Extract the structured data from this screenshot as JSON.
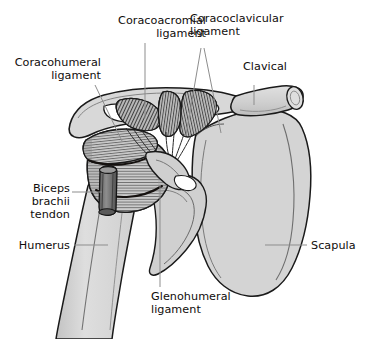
{
  "figure": {
    "background_color": "#ffffff",
    "ink_color": "#100d0c",
    "leader_color": "#8c8c8c",
    "bone_fill": "#d2d2d2",
    "bone_fill_light": "#e2e2e2",
    "ligament_fill": "#b4b4b4",
    "tendon_fill": "#6e6e6e"
  },
  "labels": [
    {
      "id": "coracoacromial-ligament",
      "text": "Coracoacromial\nligament",
      "align": "right",
      "left": 58,
      "top": 14,
      "width": 148
    },
    {
      "id": "coracoclavicular-ligament",
      "text": "Coracoclavicular\nligament",
      "align": "left",
      "left": 190,
      "top": 12,
      "width": 150
    },
    {
      "id": "coracohumeral-ligament",
      "text": "Coracohumeral\nligament",
      "align": "right",
      "left": 0,
      "top": 56,
      "width": 101
    },
    {
      "id": "clavical",
      "text": "Clavical",
      "align": "left",
      "left": 243,
      "top": 60,
      "width": 80
    },
    {
      "id": "biceps-brachii-tendon",
      "text": "Biceps\nbrachii\ntendon",
      "align": "right",
      "left": 8,
      "top": 182,
      "width": 62
    },
    {
      "id": "humerus",
      "text": "Humerus",
      "align": "right",
      "left": 6,
      "top": 239,
      "width": 64
    },
    {
      "id": "scapula",
      "text": "Scapula",
      "align": "left",
      "left": 311,
      "top": 239,
      "width": 60
    },
    {
      "id": "glenohumeral-ligament",
      "text": "Glenohumeral\nligament",
      "align": "left",
      "left": 151,
      "top": 290,
      "width": 110
    }
  ],
  "structures": [
    {
      "id": "clavicle",
      "name": "Clavical"
    },
    {
      "id": "acromion",
      "name": "Acromion"
    },
    {
      "id": "coracoid-process",
      "name": "Coracoid process"
    },
    {
      "id": "scapula-body",
      "name": "Scapula"
    },
    {
      "id": "humerus-shaft",
      "name": "Humerus"
    },
    {
      "id": "humeral-head",
      "name": "Humeral head"
    },
    {
      "id": "coracoacromial-ligament-fibers",
      "name": "Coracoacromial ligament"
    },
    {
      "id": "coracoclavicular-ligament-fibers",
      "name": "Coracoclavicular ligament"
    },
    {
      "id": "coracohumeral-ligament-fibers",
      "name": "Coracohumeral ligament"
    },
    {
      "id": "glenohumeral-ligament-capsule",
      "name": "Glenohumeral ligament"
    },
    {
      "id": "biceps-brachii-tendon-cylinder",
      "name": "Biceps brachii tendon"
    }
  ]
}
